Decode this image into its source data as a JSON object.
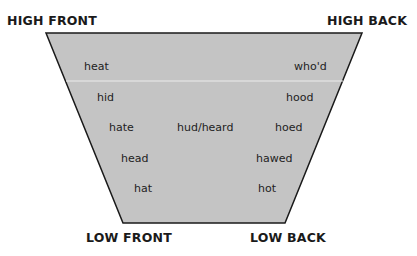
{
  "diagram": {
    "fill_color": "#c4c4c4",
    "outline_color": "#1a1a1a",
    "corners": {
      "high_front": "HIGH FRONT",
      "high_back": "HIGH BACK",
      "low_front": "LOW FRONT",
      "low_back": "LOW BACK"
    },
    "words": {
      "heat": "heat",
      "whod": "who'd",
      "hid": "hid",
      "hood": "hood",
      "hate": "hate",
      "hud_heard": "hud/heard",
      "hoed": "hoed",
      "head": "head",
      "hawed": "hawed",
      "hat": "hat",
      "hot": "hot"
    }
  }
}
